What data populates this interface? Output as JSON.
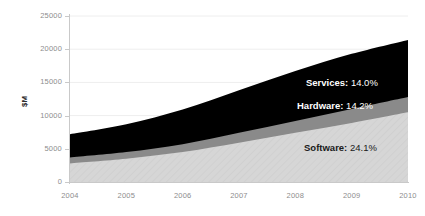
{
  "chart_data": {
    "type": "area",
    "title": "",
    "subtitle": "",
    "xlabel": "",
    "ylabel": "$M",
    "stacked": true,
    "grid": "horizontal",
    "legend_position": "inline-annotations",
    "categories": [
      "2004",
      "2005",
      "2006",
      "2007",
      "2008",
      "2009",
      "2010"
    ],
    "x": [
      2004,
      2005,
      2006,
      2007,
      2008,
      2009,
      2010
    ],
    "xlim": [
      2004,
      2010
    ],
    "ylim": [
      0,
      25000
    ],
    "ytick_labels": [
      "0",
      "5000",
      "10000",
      "15000",
      "20000",
      "25000"
    ],
    "ytick_values": [
      0,
      5000,
      10000,
      15000,
      20000,
      25000
    ],
    "xtick_labels": [
      "2004",
      "2005",
      "2006",
      "2007",
      "2008",
      "2009",
      "2010"
    ],
    "series": [
      {
        "name": "Software",
        "cagr_label": "24.1%",
        "color": "#d6d6d6",
        "values": [
          2800,
          3500,
          4500,
          5900,
          7400,
          8900,
          10500
        ]
      },
      {
        "name": "Hardware",
        "cagr_label": "14.2%",
        "color": "#8a8a8a",
        "values": [
          900,
          1000,
          1200,
          1500,
          1800,
          2100,
          2300
        ]
      },
      {
        "name": "Services",
        "cagr_label": "14.0%",
        "color": "#000000",
        "values": [
          3500,
          4200,
          5200,
          6400,
          7500,
          8300,
          8600
        ]
      }
    ],
    "cumulative_tops": {
      "software": [
        2800,
        3500,
        4500,
        5900,
        7400,
        8900,
        10500
      ],
      "hardware": [
        3700,
        4500,
        5700,
        7400,
        9200,
        11000,
        12800
      ],
      "services": [
        7200,
        8700,
        10900,
        13800,
        16700,
        19300,
        21400
      ]
    },
    "annotations": [
      {
        "id": "services-annotation",
        "name": "Services:",
        "value": "14.0%",
        "text": "Services: 14.0%",
        "color": "#ffffff"
      },
      {
        "id": "hardware-annotation",
        "name": "Hardware:",
        "value": "14.2%",
        "text": "Hardware: 14.2%",
        "color": "#ffffff"
      },
      {
        "id": "software-annotation",
        "name": "Software:",
        "value": "24.1%",
        "text": "Software: 24.1%",
        "color": "#1a1a1a"
      }
    ],
    "colors": {
      "services": "#000000",
      "hardware": "#8a8a8a",
      "software": "#d6d6d6",
      "grid": "#eeeeee",
      "axis": "#c9c9c9",
      "tick_text": "#8d8d8d",
      "axis_title": "#2b2b2b",
      "background": "#ffffff"
    }
  }
}
